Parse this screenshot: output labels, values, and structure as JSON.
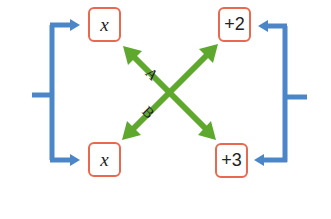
{
  "diagram": {
    "boxes": {
      "top_left": "x",
      "bottom_left": "x",
      "top_right": "+2",
      "bottom_right": "+3"
    },
    "arrow_labels": {
      "a": "A",
      "b": "B"
    },
    "colors": {
      "box_border": "#e8694f",
      "bracket": "#4a86c8",
      "arrow": "#5ea82e"
    }
  }
}
